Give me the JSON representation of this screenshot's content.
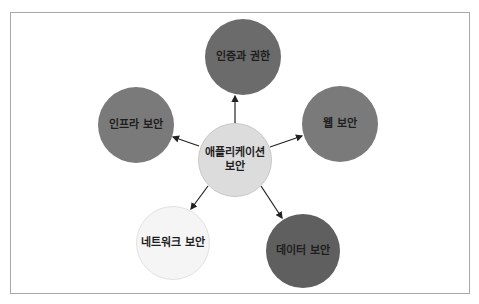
{
  "diagram": {
    "type": "hub-and-spoke",
    "center": {
      "label_line1": "애플리케이션",
      "label_line2": "보안",
      "color": "#dcdcdc",
      "cx": 235,
      "cy": 160,
      "r": 37
    },
    "nodes": [
      {
        "id": "auth",
        "label": "인증과 권한",
        "color": "#6b6b6b",
        "cx": 243,
        "cy": 57,
        "r": 38
      },
      {
        "id": "web",
        "label": "웹 보안",
        "color": "#7a7a7a",
        "cx": 340,
        "cy": 124,
        "r": 38
      },
      {
        "id": "data",
        "label": "데이터 보안",
        "color": "#5f5f5f",
        "cx": 303,
        "cy": 251,
        "r": 37
      },
      {
        "id": "network",
        "label": "네트워크 보안",
        "color": "#f5f5f5",
        "cx": 173,
        "cy": 243,
        "r": 37
      },
      {
        "id": "infra",
        "label": "인프라 보안",
        "color": "#7a7a7a",
        "cx": 136,
        "cy": 125,
        "r": 38
      }
    ],
    "edges": [
      {
        "from": "center",
        "to": "auth"
      },
      {
        "from": "center",
        "to": "web"
      },
      {
        "from": "center",
        "to": "data"
      },
      {
        "from": "center",
        "to": "network"
      },
      {
        "from": "center",
        "to": "infra"
      }
    ],
    "arrow_color": "#222222",
    "frame_border": "#a8a8a8"
  }
}
